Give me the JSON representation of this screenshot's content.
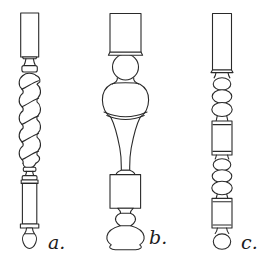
{
  "canvas": {
    "width": 268,
    "height": 266,
    "background": "#ffffff",
    "line_color": "#2a2a2a"
  },
  "figure": {
    "type": "line-drawing",
    "items": [
      {
        "id": "a",
        "label": "a.",
        "style": "barley-twist-baluster"
      },
      {
        "id": "b",
        "label": "b.",
        "style": "vase-and-ball-baluster"
      },
      {
        "id": "c",
        "label": "c.",
        "style": "bead-and-reel-baluster"
      }
    ]
  }
}
